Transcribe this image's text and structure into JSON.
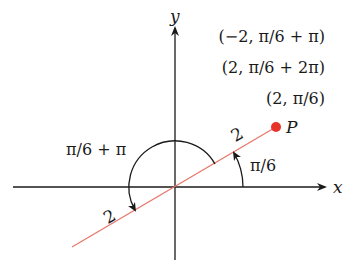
{
  "diagram": {
    "axes": {
      "x_label": "x",
      "y_label": "y",
      "origin": [
        175,
        187
      ]
    },
    "point": {
      "label": "P",
      "color": "#e8332a",
      "coordinates_labels": [
        "(−2, π/6 + π)",
        "(2, π/6 + 2π)",
        "(2, π/6)"
      ]
    },
    "line_color": "#e8776b",
    "radius_labels": [
      "2",
      "2"
    ],
    "angle_labels": {
      "small": "π/6",
      "large": "π/6 + π"
    }
  }
}
